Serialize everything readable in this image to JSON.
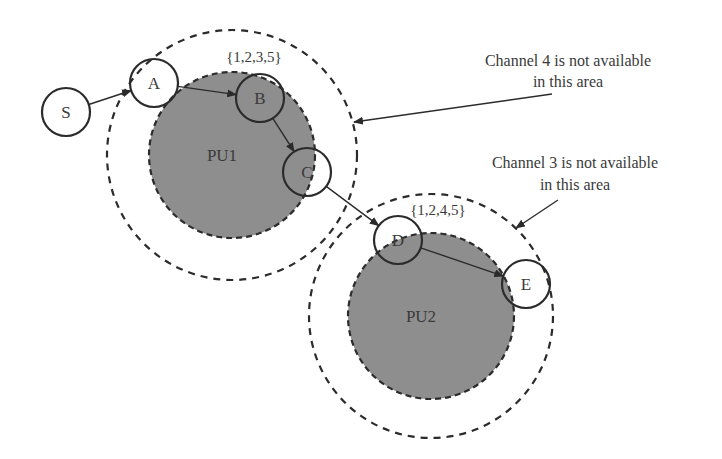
{
  "diagram": {
    "colors": {
      "pu_fill": "#8e8e8e",
      "stroke": "#2b2b2b",
      "text": "#3a3a3a",
      "background": "#ffffff"
    },
    "nodes": [
      {
        "id": "S",
        "label": "S",
        "cx": 66,
        "cy": 112,
        "r": 24
      },
      {
        "id": "A",
        "label": "A",
        "cx": 154,
        "cy": 83,
        "r": 24
      },
      {
        "id": "B",
        "label": "B",
        "cx": 260,
        "cy": 98,
        "r": 24
      },
      {
        "id": "C",
        "label": "C",
        "cx": 307,
        "cy": 172,
        "r": 24
      },
      {
        "id": "D",
        "label": "D",
        "cx": 398,
        "cy": 240,
        "r": 24
      },
      {
        "id": "E",
        "label": "E",
        "cx": 526,
        "cy": 284,
        "r": 24
      }
    ],
    "edges": [
      {
        "from": "S",
        "to": "A"
      },
      {
        "from": "A",
        "to": "B"
      },
      {
        "from": "B",
        "to": "C"
      },
      {
        "from": "C",
        "to": "D"
      },
      {
        "from": "D",
        "to": "E"
      }
    ],
    "primary_users": [
      {
        "id": "PU1",
        "label": "PU1",
        "cx": 232,
        "cy": 155,
        "r": 83,
        "range_r": 125
      },
      {
        "id": "PU2",
        "label": "PU2",
        "cx": 431,
        "cy": 316,
        "r": 83,
        "range_r": 122
      }
    ],
    "channel_sets": [
      {
        "label": "{1,2,3,5}",
        "x": 254,
        "y": 62
      },
      {
        "label": "{1,2,4,5}",
        "x": 438,
        "y": 215
      }
    ],
    "annotations": [
      {
        "line1": "Channel 4 is not available",
        "line2": "in this area",
        "x": 568,
        "y1": 66,
        "y2": 87,
        "arrow_from": [
          552,
          94
        ],
        "arrow_to": [
          354,
          122
        ]
      },
      {
        "line1": "Channel 3 is not available",
        "line2": "in this area",
        "x": 575,
        "y1": 168,
        "y2": 190,
        "arrow_from": [
          558,
          200
        ],
        "arrow_to": [
          516,
          228
        ]
      }
    ]
  }
}
